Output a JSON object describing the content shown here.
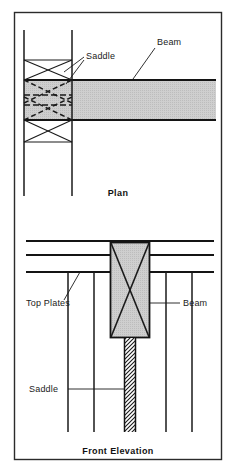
{
  "figure": {
    "background_color": "#ffffff",
    "border_color": "#2b2b2b",
    "line_color": "#1a1a1a",
    "fill_gray": "#c9c9c9",
    "text_color": "#1a1a1a"
  },
  "plan": {
    "caption": "Plan",
    "labels": {
      "saddle": "Saddle",
      "beam": "Beam"
    },
    "geometry": {
      "wall_left_x": 24,
      "wall_right_x": 72,
      "wall_top_y": 30,
      "wall_bottom_y": 196,
      "saddle_top_y": 60,
      "saddle_bottom_y": 142,
      "beam_top_y": 80,
      "beam_bottom_y": 120,
      "beam_right_x": 216
    }
  },
  "elevation": {
    "caption": "Front Elevation",
    "labels": {
      "top_plates": "Top Plates",
      "beam": "Beam",
      "saddle": "Saddle"
    },
    "geometry": {
      "plate_line_y": [
        241,
        255,
        272
      ],
      "plate_left_x": 26,
      "plate_right_x": 214,
      "beam_left_x": 110,
      "beam_right_x": 150,
      "beam_top_y": 242,
      "beam_bottom_y": 338,
      "strap_left_x": 124,
      "strap_right_x": 136,
      "strap_top_y": 338,
      "strap_bottom_y": 432,
      "stud_x": [
        68,
        94,
        166,
        192
      ],
      "stud_top_y": 272,
      "stud_bottom_y": 432
    }
  },
  "frame": {
    "x": 14,
    "y": 12,
    "width": 208,
    "height": 448
  }
}
